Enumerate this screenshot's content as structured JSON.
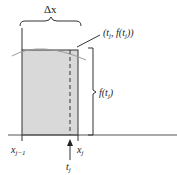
{
  "diagram": {
    "labels": {
      "delta_x": "Δx",
      "point": "(t",
      "point_sub": "j",
      "point_mid": ", f(t",
      "point_sub2": "j",
      "point_end": "))",
      "height_f": "f(t",
      "height_sub": "j",
      "height_end": ")",
      "x_left": "x",
      "x_left_sub": "j−1",
      "x_right": "x",
      "x_right_sub": "j",
      "t": "t",
      "t_sub": "j"
    },
    "colors": {
      "rect_fill": "#d9d9d9",
      "stroke": "#333333",
      "curve": "#999999"
    }
  }
}
